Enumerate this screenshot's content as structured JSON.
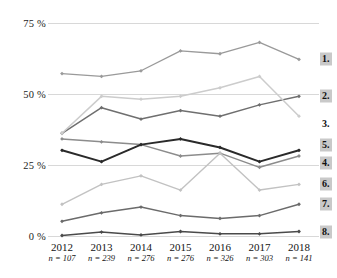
{
  "chart_data": {
    "type": "line",
    "title": "",
    "subtitle": "",
    "xlabel": "",
    "ylabel": "",
    "x": [
      "2012",
      "2013",
      "2014",
      "2015",
      "2016",
      "2017",
      "2018"
    ],
    "categories": [
      "2012",
      "2013",
      "2014",
      "2015",
      "2016",
      "2017",
      "2018"
    ],
    "sample_sizes": [
      "n = 107",
      "n = 239",
      "n = 276",
      "n = 276",
      "n = 326",
      "n = 303",
      "n = 141"
    ],
    "ylim": [
      0,
      75
    ],
    "yticks": [
      0,
      25,
      50,
      75
    ],
    "ytick_labels": [
      "0 %",
      "25 %",
      "50 %",
      "75 %"
    ],
    "grid": true,
    "legend_position": "right",
    "series": [
      {
        "name": "1.",
        "label": "1.",
        "color": "#9a9a9a",
        "width": 1.3,
        "boxed": true,
        "values": [
          57,
          56,
          58,
          65,
          64,
          68,
          62
        ]
      },
      {
        "name": "2.",
        "label": "2.",
        "color": "#6f6f6f",
        "width": 1.5,
        "boxed": true,
        "values": [
          36,
          45,
          41,
          44,
          42,
          46,
          49
        ]
      },
      {
        "name": "3.",
        "label": "3.",
        "color": "#cccccc",
        "width": 1.5,
        "boxed": false,
        "values": [
          36,
          49,
          48,
          49,
          52,
          56,
          42
        ]
      },
      {
        "name": "4.",
        "label": "4.",
        "color": "#8c8c8c",
        "width": 1.5,
        "boxed": true,
        "values": [
          34,
          33,
          32,
          28,
          29,
          24,
          28
        ]
      },
      {
        "name": "5.",
        "label": "5.",
        "color": "#2a2a2a",
        "width": 2.0,
        "boxed": true,
        "values": [
          30,
          26,
          32,
          34,
          31,
          26,
          30
        ]
      },
      {
        "name": "6.",
        "label": "6.",
        "color": "#c2c2c2",
        "width": 1.4,
        "boxed": true,
        "values": [
          11,
          18,
          21,
          16,
          29,
          16,
          18
        ]
      },
      {
        "name": "7.",
        "label": "7.",
        "color": "#6b6b6b",
        "width": 1.5,
        "boxed": true,
        "values": [
          5,
          8,
          10,
          7,
          6,
          7,
          11
        ]
      },
      {
        "name": "8.",
        "label": "8.",
        "color": "#4a4a4a",
        "width": 1.5,
        "boxed": true,
        "values": [
          0,
          1.2,
          0.2,
          1.4,
          0.6,
          0.6,
          1.4
        ]
      }
    ],
    "legend_labels": [
      "1.",
      "2.",
      "3.",
      "4.",
      "5.",
      "6.",
      "7.",
      "8."
    ],
    "marker": "diamond",
    "gridline_color": "#d8d8d8"
  }
}
